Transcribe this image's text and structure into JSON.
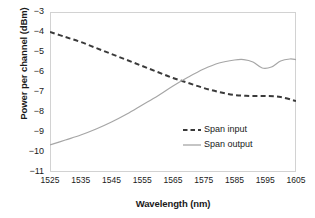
{
  "chart_data": {
    "type": "line",
    "title": "",
    "xlabel": "Wavelength (nm)",
    "ylabel": "Power per channel (dBm)",
    "xlim": [
      1525,
      1605
    ],
    "ylim": [
      -11,
      -3
    ],
    "xticks": [
      1525,
      1535,
      1545,
      1555,
      1565,
      1575,
      1585,
      1595,
      1605
    ],
    "yticks": [
      -3,
      -4,
      -5,
      -6,
      -7,
      -8,
      -9,
      -10,
      -11
    ],
    "grid": false,
    "legend_position": "inside-lower-right",
    "series": [
      {
        "name": "Span input",
        "style": "dashed",
        "color": "#3a3a3a",
        "x": [
          1525,
          1530,
          1535,
          1540,
          1545,
          1550,
          1555,
          1560,
          1565,
          1570,
          1575,
          1580,
          1585,
          1590,
          1595,
          1600,
          1605
        ],
        "y": [
          -4.0,
          -4.25,
          -4.5,
          -4.8,
          -5.1,
          -5.4,
          -5.7,
          -6.0,
          -6.3,
          -6.55,
          -6.8,
          -7.0,
          -7.15,
          -7.2,
          -7.2,
          -7.25,
          -7.45
        ]
      },
      {
        "name": "Span output",
        "style": "solid",
        "color": "#a6a6a6",
        "x": [
          1525,
          1530,
          1535,
          1540,
          1545,
          1550,
          1555,
          1560,
          1565,
          1570,
          1575,
          1580,
          1585,
          1588,
          1591,
          1594,
          1597,
          1600,
          1603,
          1605
        ],
        "y": [
          -9.65,
          -9.4,
          -9.15,
          -8.85,
          -8.5,
          -8.1,
          -7.65,
          -7.2,
          -6.7,
          -6.25,
          -5.85,
          -5.55,
          -5.4,
          -5.38,
          -5.5,
          -5.8,
          -5.75,
          -5.45,
          -5.35,
          -5.38
        ]
      }
    ]
  },
  "legend": {
    "items": [
      {
        "label": "Span input"
      },
      {
        "label": "Span output"
      }
    ]
  },
  "axis_labels": {
    "x_title": "Wavelength (nm)",
    "y_title": "Power per channel (dBm)"
  },
  "ytick_labels": [
    "−3",
    "−4",
    "−5",
    "−6",
    "−7",
    "−8",
    "−9",
    "−10",
    "−11"
  ],
  "xtick_labels": [
    "1525",
    "1535",
    "1545",
    "1555",
    "1565",
    "1575",
    "1585",
    "1595",
    "1605"
  ]
}
